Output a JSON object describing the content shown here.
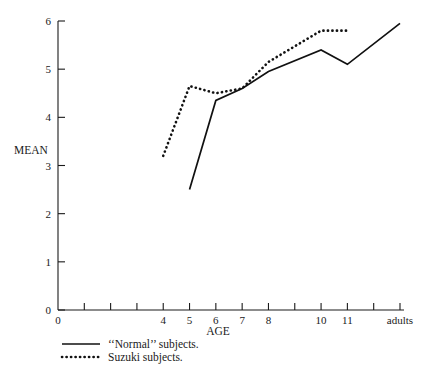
{
  "chart_data": {
    "type": "line",
    "title": "",
    "xlabel": "AGE",
    "ylabel": "MEAN",
    "ylim": [
      0,
      6
    ],
    "yticks": [
      0,
      1,
      2,
      3,
      4,
      5,
      6
    ],
    "ytick_labels": [
      "0",
      "1",
      "2",
      "3",
      "4",
      "5",
      "6"
    ],
    "x_categories": [
      "0",
      "",
      "",
      "",
      "4",
      "5",
      "6",
      "7",
      "8",
      "",
      "10",
      "11",
      "",
      "adults"
    ],
    "xtick_labels": [
      "0",
      "",
      "",
      "",
      "4",
      "5",
      "6",
      "7",
      "8",
      "",
      "10",
      "11",
      "",
      "adults"
    ],
    "grid": false,
    "legend_position": "below-left",
    "series": [
      {
        "name": "‘‘Normal’’ subjects.",
        "style": "solid",
        "color": "#111111",
        "points": [
          {
            "x": "5",
            "y": 2.5
          },
          {
            "x": "6",
            "y": 4.35
          },
          {
            "x": "7",
            "y": 4.6
          },
          {
            "x": "8",
            "y": 4.95
          },
          {
            "x": "10",
            "y": 5.4
          },
          {
            "x": "11",
            "y": 5.1
          },
          {
            "x": "adults",
            "y": 5.95
          }
        ]
      },
      {
        "name": "Suzuki subjects.",
        "style": "dotted",
        "color": "#111111",
        "points": [
          {
            "x": "4",
            "y": 3.2
          },
          {
            "x": "5",
            "y": 4.65
          },
          {
            "x": "6",
            "y": 4.5
          },
          {
            "x": "7",
            "y": 4.6
          },
          {
            "x": "8",
            "y": 5.15
          },
          {
            "x": "10",
            "y": 5.8
          },
          {
            "x": "11",
            "y": 5.8
          }
        ]
      }
    ]
  },
  "legend": {
    "items": [
      {
        "label": "‘‘Normal’’ subjects.",
        "style": "solid"
      },
      {
        "label": "Suzuki subjects.",
        "style": "dotted"
      }
    ]
  },
  "axes": {
    "y_title": "MEAN",
    "x_title": "AGE"
  }
}
